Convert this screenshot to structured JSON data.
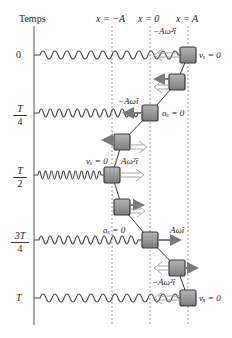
{
  "diagram": {
    "type": "spring-mass oscillation timeline",
    "axis_title": "Temps",
    "positions": [
      {
        "label": "x = −A",
        "x": 112
      },
      {
        "label": "x = 0",
        "x": 150
      },
      {
        "label": "x = A",
        "x": 188
      }
    ],
    "times": [
      {
        "num": "0",
        "den": "",
        "y": 55
      },
      {
        "num": "T",
        "den": "4",
        "y": 113
      },
      {
        "num": "T",
        "den": "2",
        "y": 175
      },
      {
        "num": "3T",
        "den": "4",
        "y": 240
      },
      {
        "num": "T",
        "den": "",
        "y": 298
      }
    ],
    "annotations": {
      "t0_accel": "−Aω²î",
      "t0_vel": "vₓ = 0",
      "tq_vel": "−Aωî",
      "tq_accel": "aₓ = 0",
      "th_vel": "vₓ = 0",
      "th_accel": "Aω²î",
      "t3q_accel": "aₓ = 0",
      "t3q_vel": "Aωî",
      "tT_accel": "−Aω²î",
      "tT_vel": "vₓ = 0"
    },
    "colors": {
      "block_fill": "#8e8e8e",
      "block_border": "#3a3a3a",
      "spring": "#444444",
      "velocity_arrow": "#7a7a7a",
      "accel_arrow": "#9a9a9a",
      "axis": "#555555"
    }
  }
}
